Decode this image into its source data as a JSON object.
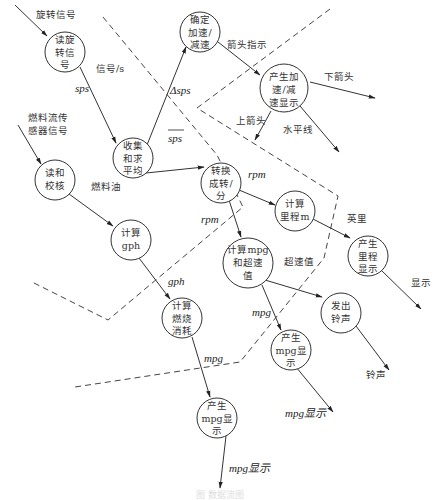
{
  "diagram": {
    "type": "data-flow-diagram",
    "nodes": [
      {
        "id": "read_rotation",
        "lines": [
          "读旋",
          "转信",
          "号"
        ]
      },
      {
        "id": "collect_average",
        "lines": [
          "收集",
          "和求",
          "平均"
        ]
      },
      {
        "id": "determine_accel",
        "lines": [
          "确定",
          "加速/",
          "减速"
        ]
      },
      {
        "id": "accel_display",
        "lines": [
          "产生加",
          "速/减",
          "速显示"
        ]
      },
      {
        "id": "convert_rpm",
        "lines": [
          "转换",
          "成转/",
          "分"
        ]
      },
      {
        "id": "calc_mileage",
        "lines": [
          "计算",
          "里程m"
        ]
      },
      {
        "id": "read_check",
        "lines": [
          "读和",
          "校核"
        ]
      },
      {
        "id": "calc_gph",
        "lines": [
          "计算",
          "gph"
        ]
      },
      {
        "id": "calc_mpg_speed",
        "lines": [
          "计算mpg",
          "和超速",
          "值"
        ]
      },
      {
        "id": "mileage_display",
        "lines": [
          "产生",
          "里程",
          "显示"
        ]
      },
      {
        "id": "sound_bell",
        "lines": [
          "发出",
          "铃声"
        ]
      },
      {
        "id": "mpg_display_1",
        "lines": [
          "产生",
          "mpg显",
          "示"
        ]
      },
      {
        "id": "calc_fuel",
        "lines": [
          "计算",
          "燃烧",
          "消耗"
        ]
      },
      {
        "id": "mpg_display_2",
        "lines": [
          "产生",
          "mpg显",
          "示"
        ]
      }
    ],
    "flow_labels": {
      "rotation_signal": "旋转信号",
      "signal_per_s": "信号/s",
      "sps": "sps",
      "delta_sps": "Δsps",
      "sps_avg": "sps",
      "arrow_indicator": "箭头指示",
      "down_arrow": "下箭头",
      "up_arrow": "上箭头",
      "horizontal_line": "水平线",
      "rpm_1": "rpm",
      "rpm_2": "rpm",
      "miles": "英里",
      "display": "显示",
      "fuel_sensor_1": "燃料流传",
      "fuel_sensor_2": "感器信号",
      "fuel_oil": "燃料油",
      "gph": "gph",
      "overspeed": "超速值",
      "mpg_1": "mpg",
      "mpg_2": "mpg",
      "bell": "铃声",
      "mpg_display_out_1": "mpg显示",
      "mpg_display_out_2": "mpg显示"
    },
    "caption": "图 数据流图"
  }
}
